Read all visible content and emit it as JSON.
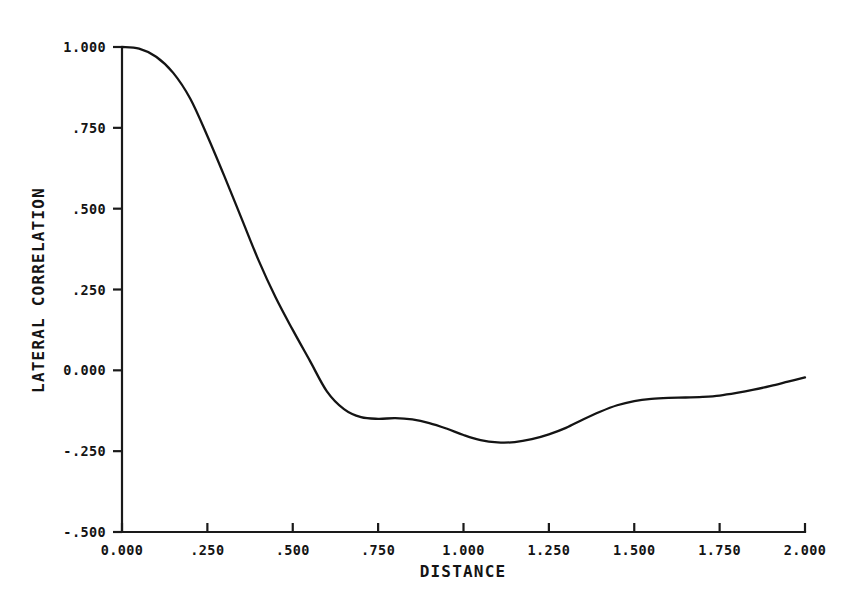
{
  "chart_data": {
    "type": "line",
    "title": "",
    "xlabel": "DISTANCE",
    "ylabel": "LATERAL CORRELATION",
    "xlim": [
      0.0,
      2.0
    ],
    "ylim": [
      -0.5,
      1.0
    ],
    "grid": false,
    "legend": null,
    "x_ticks": [
      0.0,
      0.25,
      0.5,
      0.75,
      1.0,
      1.25,
      1.5,
      1.75,
      2.0
    ],
    "x_tick_labels": [
      "0.000",
      ".250",
      ".500",
      ".750",
      "1.000",
      "1.250",
      "1.500",
      "1.750",
      "2.000"
    ],
    "y_ticks": [
      1.0,
      0.75,
      0.5,
      0.25,
      0.0,
      -0.25,
      -0.5
    ],
    "y_tick_labels": [
      "1.000",
      ".750",
      ".500",
      ".250",
      "0.000",
      "-.250",
      "-.500"
    ],
    "series": [
      {
        "name": "lateral correlation",
        "color": "#141414",
        "x": [
          0.0,
          0.05,
          0.1,
          0.15,
          0.2,
          0.25,
          0.3,
          0.35,
          0.4,
          0.45,
          0.5,
          0.55,
          0.6,
          0.65,
          0.7,
          0.75,
          0.8,
          0.85,
          0.9,
          0.95,
          1.0,
          1.05,
          1.1,
          1.15,
          1.2,
          1.25,
          1.3,
          1.35,
          1.4,
          1.45,
          1.5,
          1.55,
          1.6,
          1.65,
          1.7,
          1.75,
          1.8,
          1.85,
          1.9,
          1.95,
          2.0
        ],
        "y": [
          1.0,
          0.995,
          0.97,
          0.92,
          0.84,
          0.725,
          0.6,
          0.47,
          0.34,
          0.225,
          0.125,
          0.03,
          -0.065,
          -0.12,
          -0.145,
          -0.15,
          -0.148,
          -0.152,
          -0.163,
          -0.18,
          -0.2,
          -0.216,
          -0.223,
          -0.222,
          -0.213,
          -0.198,
          -0.178,
          -0.152,
          -0.128,
          -0.108,
          -0.095,
          -0.088,
          -0.085,
          -0.084,
          -0.082,
          -0.078,
          -0.07,
          -0.06,
          -0.048,
          -0.035,
          -0.022
        ]
      }
    ]
  },
  "axes": {
    "x_title": "DISTANCE",
    "y_title": "LATERAL CORRELATION"
  }
}
